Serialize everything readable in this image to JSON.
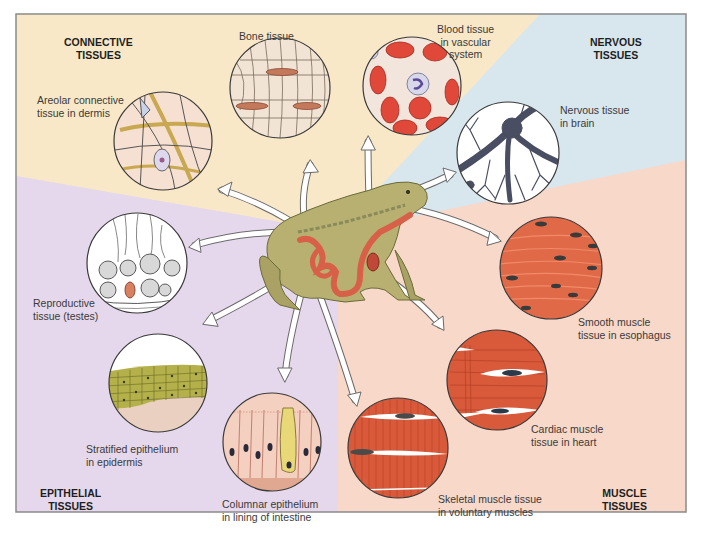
{
  "figure": {
    "colors": {
      "connective_bg": "#f8e8c8",
      "nervous_bg": "#d8e6ee",
      "muscle_bg": "#f8d8c8",
      "epithelial_bg": "#e6d8ec",
      "frame": "#8a8a8a",
      "arrow_fill": "#ffffff",
      "arrow_stroke": "#6a6a6a",
      "muscle_red": "#d85a3a",
      "blood_red": "#e0493a",
      "frog_green": "#b8b070",
      "gut_red": "#d86048"
    }
  },
  "regions": [
    {
      "id": "connective",
      "label": "CONNECTIVE\nTISSUES"
    },
    {
      "id": "nervous",
      "label": "NERVOUS\nTISSUES"
    },
    {
      "id": "muscle",
      "label": "MUSCLE\nTISSUES"
    },
    {
      "id": "epithelial",
      "label": "EPITHELIAL\nTISSUES"
    }
  ],
  "tissues": {
    "areolar": {
      "label": "Areolar connective\ntissue in dermis",
      "group": "connective"
    },
    "bone": {
      "label": "Bone tissue",
      "group": "connective"
    },
    "blood": {
      "label": "Blood tissue\nin vascular\nsystem",
      "group": "connective"
    },
    "nervous": {
      "label": "Nervous tissue\nin brain",
      "group": "nervous"
    },
    "smooth": {
      "label": "Smooth muscle\ntissue in esophagus",
      "group": "muscle"
    },
    "cardiac": {
      "label": "Cardiac muscle\ntissue in heart",
      "group": "muscle"
    },
    "skeletal": {
      "label": "Skeletal muscle tissue\nin voluntary muscles",
      "group": "muscle"
    },
    "columnar": {
      "label": "Columnar epithelium\nin lining of intestine",
      "group": "epithelial"
    },
    "stratified": {
      "label": "Stratified epithelium\nin epidermis",
      "group": "epithelial"
    },
    "reproductive": {
      "label": "Reproductive\ntissue (testes)",
      "group": "epithelial"
    }
  },
  "center": {
    "label": "frog-anatomy"
  }
}
